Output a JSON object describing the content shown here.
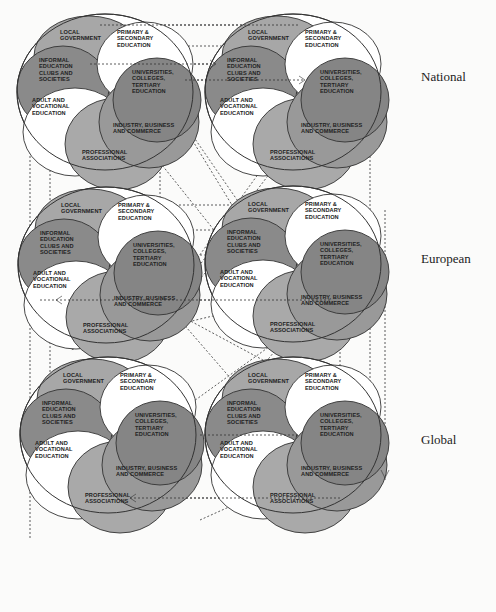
{
  "levels": [
    {
      "label": "National"
    },
    {
      "label": "European"
    },
    {
      "label": "Global"
    }
  ],
  "sectors": {
    "local_government": [
      "LOCAL",
      "GOVERNMENT"
    ],
    "primary_secondary": [
      "PRIMARY &",
      "SECONDARY",
      "EDUCATION"
    ],
    "informal": [
      "INFORMAL",
      "EDUCATION",
      "CLUBS AND",
      "SOCIETIES"
    ],
    "universities": [
      "UNIVERSITIES,",
      "COLLEGES,",
      "TERTIARY",
      "EDUCATION"
    ],
    "adult_vocational": [
      "ADULT AND",
      "VOCATIONAL",
      "EDUCATION"
    ],
    "industry": [
      "INDUSTRY, BUSINESS",
      "AND COMMERCE"
    ],
    "professional": [
      "PROFESSIONAL",
      "ASSOCIATIONS"
    ]
  },
  "colors": {
    "background": "#fbfbfa",
    "local_government": "#a7a7a7",
    "informal": "#8a8a8a",
    "universities": "#858585",
    "industry": "#999999",
    "professional": "#a9a9a9",
    "primary_secondary": "#ffffff",
    "adult_vocational": "#ffffff"
  },
  "clusters": [
    {
      "level": "National",
      "position": "left"
    },
    {
      "level": "National",
      "position": "right"
    },
    {
      "level": "European",
      "position": "left"
    },
    {
      "level": "European",
      "position": "right"
    },
    {
      "level": "Global",
      "position": "left"
    },
    {
      "level": "Global",
      "position": "right"
    }
  ]
}
